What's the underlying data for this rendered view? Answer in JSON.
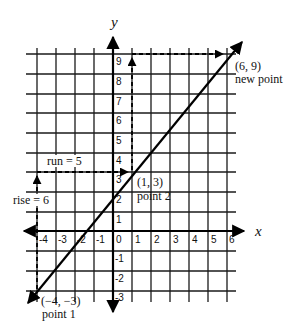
{
  "diagram": {
    "type": "coordinate-plane-slope",
    "axes": {
      "x_label": "x",
      "y_label": "y",
      "x_ticks": [
        "-4",
        "-3",
        "-2",
        "-1",
        "0",
        "1",
        "2",
        "3",
        "4",
        "5",
        "6"
      ],
      "y_ticks": [
        "9",
        "8",
        "7",
        "6",
        "5",
        "4",
        "3",
        "2",
        "1",
        "-1",
        "-2",
        "-3"
      ]
    },
    "line": {
      "from": [
        -4,
        -3
      ],
      "to": [
        6,
        9
      ],
      "passes_through": [
        1,
        3
      ]
    },
    "points": [
      {
        "coords": "(−4, −3)",
        "label": "point 1"
      },
      {
        "coords": "(1, 3)",
        "label": "point 2"
      },
      {
        "coords": "(6, 9)",
        "label": "new point"
      }
    ],
    "annotations": {
      "rise": "rise = 6",
      "run": "run = 5"
    }
  }
}
